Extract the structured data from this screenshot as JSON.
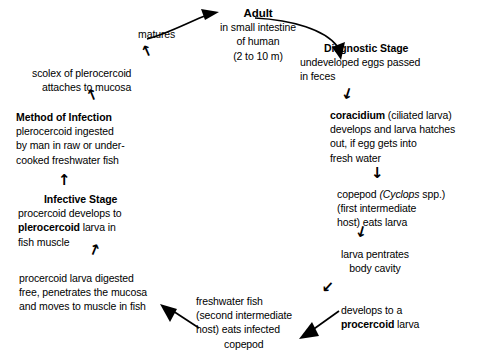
{
  "diagram": {
    "type": "cycle-flow-diagram",
    "nodes": [
      {
        "id": "adult",
        "header": "Adult",
        "lines": [
          "in small intestine",
          "of human",
          "(2 to 10 m)"
        ]
      },
      {
        "id": "diagnostic-stage",
        "header": "Diagnostic Stage",
        "lines": [
          "undeveloped eggs passed",
          "in feces"
        ]
      },
      {
        "id": "coracidium",
        "line1_bold": "coracidium",
        "line1_rest": " (ciliated larva)",
        "lines": [
          "develops and larva hatches",
          "out, if egg gets into",
          "fresh water"
        ]
      },
      {
        "id": "copepod",
        "line1_a": "copepod ",
        "line1_italic": "Cyclops",
        "line1_b": " spp.)",
        "line1_paren": "(",
        "lines": [
          "(first intermediate",
          "host) eats larva"
        ]
      },
      {
        "id": "larva-penetrates",
        "lines": [
          "larva pentrates",
          "body cavity"
        ]
      },
      {
        "id": "procercoid",
        "lines": [
          "develops to a"
        ],
        "line2_bold": "procercoid",
        "line2_rest": " larva"
      },
      {
        "id": "freshwater-fish",
        "lines": [
          "freshwater fish",
          "(second intermediate",
          "host) eats infected",
          "copepod"
        ]
      },
      {
        "id": "procercoid-digested",
        "lines": [
          "procercoid larva digested",
          "free, penetrates the mucosa",
          "and moves to muscle in fish"
        ]
      },
      {
        "id": "infective-stage",
        "header": "Infective Stage",
        "lines": [
          "procercoid develops to"
        ],
        "line2_bold": "plerocercoid",
        "line2_rest": " larva in",
        "line3": "fish muscle"
      },
      {
        "id": "method-of-infection",
        "header": "Method of Infection",
        "lines": [
          "plerocercoid ingested",
          "by man in raw or under-",
          "cooked freshwater fish"
        ]
      },
      {
        "id": "scolex",
        "lines": [
          "scolex of plerocercoid",
          "attaches to mucosa"
        ]
      },
      {
        "id": "matures",
        "lines": [
          "matures"
        ]
      }
    ],
    "arrow_glyphs": {
      "up": "↑",
      "down": "↓",
      "up_right": "↗",
      "up_left": "↖",
      "down_left": "↙",
      "down_right": "↘"
    },
    "colors": {
      "ink": "#000000",
      "background": "#ffffff"
    }
  }
}
